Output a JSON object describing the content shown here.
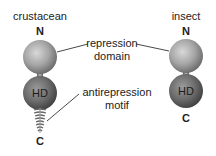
{
  "diagram": {
    "left_protein": {
      "title": "crustacean",
      "n_terminus": "N",
      "c_terminus": "C",
      "domain_label": "HD",
      "has_antirepression_motif": true
    },
    "right_protein": {
      "title": "insect",
      "n_terminus": "N",
      "c_terminus": "C",
      "domain_label": "HD",
      "has_antirepression_motif": false
    },
    "annotations": {
      "repression_line1": "repression",
      "repression_line2": "domain",
      "antirepression_line1": "antirepression",
      "antirepression_line2": "motif"
    },
    "colors": {
      "repression_sphere": "#a6a6a6",
      "hd_sphere": "#6e6e6e",
      "stalk": "#8a8a8a",
      "text": "#222222",
      "leader_line": "#333333"
    }
  }
}
